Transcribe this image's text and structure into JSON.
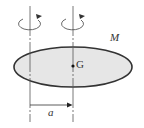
{
  "diagram": {
    "type": "parallel-axis-theorem",
    "labels": {
      "mass": "M",
      "center_of_gravity": "G",
      "distance": "a"
    },
    "colors": {
      "body_fill": "#e6e6e6",
      "outline": "#333333",
      "axis_line": "#555555"
    },
    "axes": [
      {
        "name": "offset-axis",
        "rotation": "counterclockwise-arrow"
      },
      {
        "name": "center-axis",
        "rotation": "counterclockwise-arrow"
      }
    ]
  }
}
